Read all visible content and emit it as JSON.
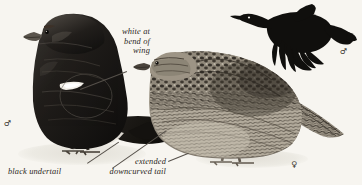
{
  "plate": {
    "background_color": "#f7f5f0",
    "ink_color": "#1a1715",
    "label_color": "#2b2722",
    "leader_color": "#55504a"
  },
  "annotations": [
    {
      "name": "white-at-bend-of-wing",
      "lines": [
        "white at",
        "bend of",
        "wing"
      ],
      "line1": "white at",
      "line2": "bend of",
      "line3": "wing",
      "align": "right"
    },
    {
      "name": "black-undertail",
      "lines": [
        "black undertail"
      ],
      "line1": "black undertail",
      "align": "left"
    },
    {
      "name": "extended-downcurved-tail",
      "lines": [
        "extended",
        "downcurved tail"
      ],
      "line1": "extended",
      "line2": "downcurved tail",
      "align": "right"
    }
  ],
  "symbols": {
    "male": "♂",
    "female": "♀",
    "male_perched_label": "♂",
    "male_flight_label": "♂",
    "female_perched_label": "♀"
  },
  "figures": [
    {
      "name": "male-perched",
      "sex": "♂",
      "plumage": "glossy-black",
      "features": [
        "white shoulder patch",
        "long downcurved lyre tail",
        "black undertail"
      ]
    },
    {
      "name": "female-perched",
      "sex": "♀",
      "plumage": "barred-grey-brown",
      "features": [
        "mottled barred body",
        "notched tail"
      ]
    },
    {
      "name": "male-in-flight",
      "sex": "♂",
      "plumage": "black-silhouette",
      "features": [
        "spread primaries",
        "long tail",
        "outstretched neck"
      ]
    }
  ]
}
